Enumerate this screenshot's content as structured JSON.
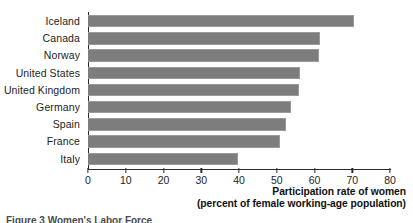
{
  "chart_data": {
    "type": "bar",
    "orientation": "horizontal",
    "title": "",
    "xlabel": "Participation rate of women (percent of female working-age population)",
    "ylabel": "",
    "xlim": [
      0,
      80
    ],
    "xticks": [
      0,
      10,
      20,
      30,
      40,
      50,
      60,
      70,
      80
    ],
    "grid": false,
    "legend": false,
    "categories": [
      "Iceland",
      "Canada",
      "Norway",
      "United States",
      "United Kingdom",
      "Germany",
      "Spain",
      "France",
      "Italy"
    ],
    "values": [
      70.4,
      61.4,
      61.3,
      56.1,
      55.8,
      53.7,
      52.4,
      50.8,
      39.7
    ],
    "bar_color": "#7d7d7d",
    "axis_color": "#2b2b2b",
    "background_color": "#ffffff"
  },
  "axis_title": {
    "line1": "Participation rate of women",
    "line2": "(percent of female working-age population)"
  },
  "figure_caption": {
    "clipped_text": "Figure 3 Women's Labor Force"
  }
}
